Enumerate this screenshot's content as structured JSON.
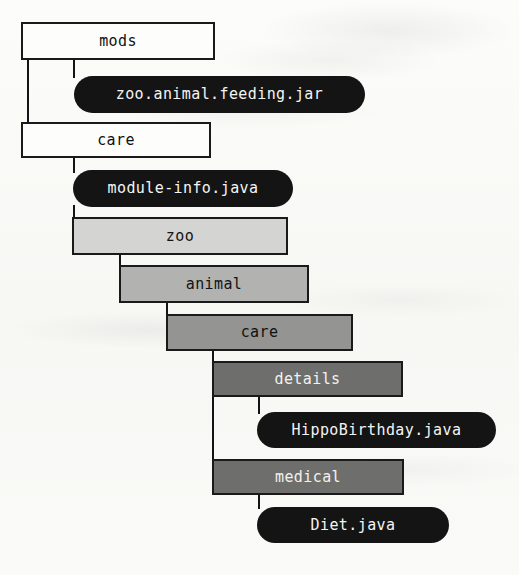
{
  "figure": {
    "kind": "directory-tree-diagram",
    "legend": {
      "directory_shape": "rectangle",
      "file_shape": "rounded-pill"
    },
    "colors": {
      "background": "#fbfbf9",
      "line": "#141414",
      "level0_fill": "#fdfdfc",
      "level1_fill": "#d4d4d2",
      "level2_fill": "#b2b2b0",
      "level3_fill": "#949492",
      "level4_fill": "#6e6e6c",
      "file_fill": "#141414",
      "file_text": "#f4f4f2"
    }
  },
  "nodes": {
    "mods": {
      "label": "mods",
      "type": "directory",
      "level": 0
    },
    "jar": {
      "label": "zoo.animal.feeding.jar",
      "type": "file",
      "level": 1
    },
    "care_root": {
      "label": "care",
      "type": "directory",
      "level": 0
    },
    "module_info": {
      "label": "module-info.java",
      "type": "file",
      "level": 1
    },
    "zoo": {
      "label": "zoo",
      "type": "directory",
      "level": 1
    },
    "animal": {
      "label": "animal",
      "type": "directory",
      "level": 2
    },
    "care_pkg": {
      "label": "care",
      "type": "directory",
      "level": 3
    },
    "details": {
      "label": "details",
      "type": "directory",
      "level": 4
    },
    "hippo": {
      "label": "HippoBirthday.java",
      "type": "file",
      "level": 5
    },
    "medical": {
      "label": "medical",
      "type": "directory",
      "level": 4
    },
    "diet": {
      "label": "Diet.java",
      "type": "file",
      "level": 5
    }
  }
}
